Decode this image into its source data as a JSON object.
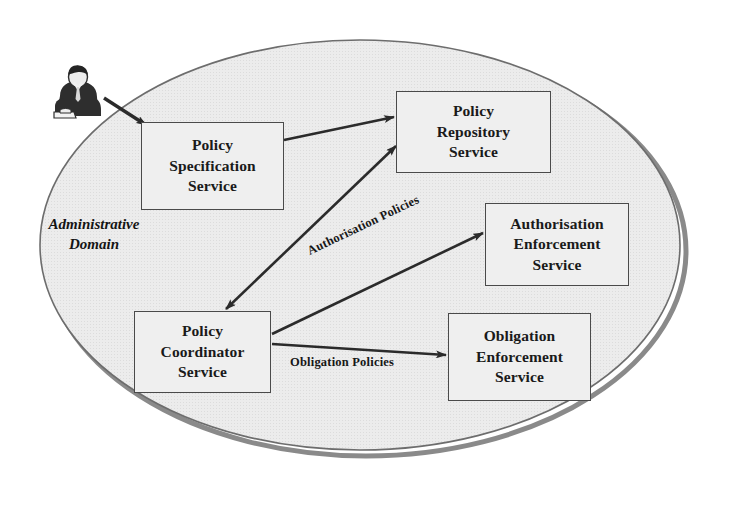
{
  "diagram": {
    "domain_boundary": {
      "label": "Administrative\nDomain",
      "shape": "ellipse",
      "fill_color": "#e9e9e9",
      "stroke_color": "#6f6f6f",
      "shadow_color": "#7d7d7d"
    },
    "actor": {
      "name": "administrator",
      "icon": "person-at-desk-icon"
    },
    "nodes": [
      {
        "id": "policy-specification-service",
        "label": "Policy\nSpecification\nService",
        "x": 141,
        "y": 122,
        "width": 143,
        "height": 88
      },
      {
        "id": "policy-repository-service",
        "label": "Policy\nRepository\nService",
        "x": 396,
        "y": 91,
        "width": 155,
        "height": 82
      },
      {
        "id": "authorisation-enforcement-service",
        "label": "Authorisation\nEnforcement\nService",
        "x": 485,
        "y": 203,
        "width": 144,
        "height": 83
      },
      {
        "id": "policy-coordinator-service",
        "label": "Policy\nCoordinator\nService",
        "x": 134,
        "y": 311,
        "width": 137,
        "height": 82
      },
      {
        "id": "obligation-enforcement-service",
        "label": "Obligation\nEnforcement\nService",
        "x": 448,
        "y": 313,
        "width": 143,
        "height": 88
      }
    ],
    "edges": [
      {
        "id": "administrator-to-policy-specification",
        "from": "administrator",
        "to": "policy-specification-service",
        "label": "",
        "arrows": "single"
      },
      {
        "id": "policy-specification-to-policy-repository",
        "from": "policy-specification-service",
        "to": "policy-repository-service",
        "label": "",
        "arrows": "single"
      },
      {
        "id": "policy-coordinator-to-policy-repository",
        "from": "policy-coordinator-service",
        "to": "policy-repository-service",
        "label": "",
        "arrows": "double"
      },
      {
        "id": "policy-coordinator-to-authorisation-enforcement",
        "from": "policy-coordinator-service",
        "to": "authorisation-enforcement-service",
        "label": "Authorisation Policies",
        "arrows": "single"
      },
      {
        "id": "policy-coordinator-to-obligation-enforcement",
        "from": "policy-coordinator-service",
        "to": "obligation-enforcement-service",
        "label": "Obligation Policies",
        "arrows": "single"
      }
    ],
    "edge_labels": {
      "authorisation_policies": "Authorisation Policies",
      "obligation_policies": "Obligation Policies"
    }
  }
}
